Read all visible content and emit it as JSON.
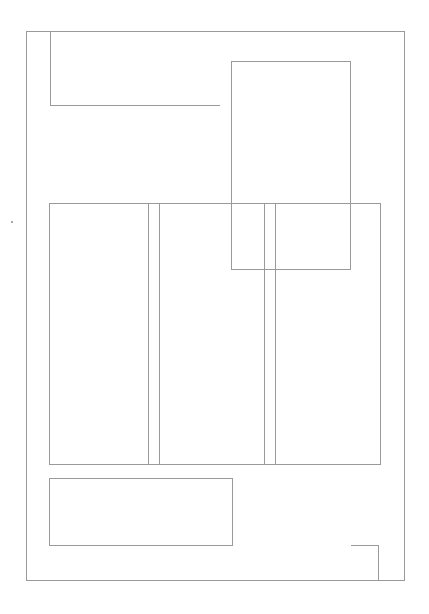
{
  "diagram": {
    "type": "wireframe-layout",
    "stroke_color": "#9a9a9a",
    "background": "#ffffff",
    "elements": [
      {
        "id": "outer-frame",
        "kind": "rect",
        "x": 26,
        "y": 31,
        "w": 378,
        "h": 549
      },
      {
        "id": "top-left-bracket",
        "kind": "polyline",
        "points": [
          [
            50,
            31
          ],
          [
            50,
            105
          ],
          [
            220,
            105
          ]
        ]
      },
      {
        "id": "tall-rect",
        "kind": "rect",
        "x": 231,
        "y": 61,
        "w": 119,
        "h": 208
      },
      {
        "id": "column-row",
        "kind": "rect",
        "x": 49,
        "y": 203,
        "w": 331,
        "h": 261
      },
      {
        "id": "column-divider-1a",
        "kind": "vline",
        "x": 148,
        "y1": 203,
        "y2": 464
      },
      {
        "id": "column-divider-1b",
        "kind": "vline",
        "x": 159,
        "y1": 203,
        "y2": 464
      },
      {
        "id": "column-divider-2a",
        "kind": "vline",
        "x": 264,
        "y1": 203,
        "y2": 464
      },
      {
        "id": "column-divider-2b",
        "kind": "vline",
        "x": 275,
        "y1": 203,
        "y2": 464
      },
      {
        "id": "bottom-left-rect",
        "kind": "rect",
        "x": 49,
        "y": 478,
        "w": 183,
        "h": 67
      },
      {
        "id": "bottom-right-bracket",
        "kind": "polyline",
        "points": [
          [
            351,
            545
          ],
          [
            378,
            545
          ],
          [
            378,
            580
          ]
        ]
      },
      {
        "id": "stray-dot",
        "kind": "dot",
        "x": 12,
        "y": 222
      }
    ]
  }
}
